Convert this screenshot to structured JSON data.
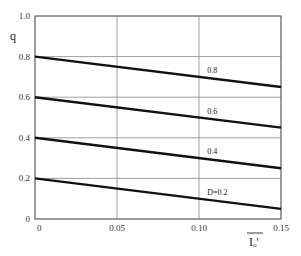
{
  "chart_data": {
    "type": "line",
    "title": "",
    "xlabel": "Iₒ'",
    "ylabel": "q",
    "xlim": [
      0,
      0.15
    ],
    "ylim": [
      0,
      1.0
    ],
    "grid": true,
    "x_ticks": [
      "0",
      "0.05",
      "0.10",
      "0.15"
    ],
    "x_tick_values": [
      0,
      0.05,
      0.1,
      0.15
    ],
    "y_ticks": [
      "0",
      "0.2",
      "0.4",
      "0.6",
      "0.8",
      "1.0"
    ],
    "y_tick_values": [
      0,
      0.2,
      0.4,
      0.6,
      0.8,
      1.0
    ],
    "series": [
      {
        "name": "0.8",
        "label": "0.8",
        "x": [
          0,
          0.15
        ],
        "y": [
          0.8,
          0.65
        ]
      },
      {
        "name": "0.6",
        "label": "0.6",
        "x": [
          0,
          0.15
        ],
        "y": [
          0.6,
          0.45
        ]
      },
      {
        "name": "0.4",
        "label": "0.4",
        "x": [
          0,
          0.15
        ],
        "y": [
          0.4,
          0.25
        ]
      },
      {
        "name": "0.2",
        "label": "D=0.2",
        "x": [
          0,
          0.15
        ],
        "y": [
          0.2,
          0.05
        ]
      }
    ],
    "label_x": 0.105
  }
}
